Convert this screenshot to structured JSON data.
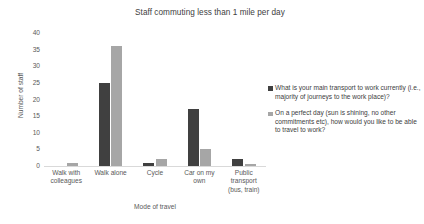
{
  "chart_data": {
    "type": "bar",
    "title": "Staff commuting less than 1 mile per day",
    "xlabel": "Mode of travel",
    "ylabel": "Number of staff",
    "ylim": [
      0,
      40
    ],
    "ytick_step": 5,
    "yticks": [
      0,
      5,
      10,
      15,
      20,
      25,
      30,
      35,
      40
    ],
    "grid": false,
    "legend_position": "right",
    "categories": [
      "Walk with colleagues",
      "Walk alone",
      "Cycle",
      "Car on my own",
      "Public transport (bus, train)"
    ],
    "category_lines": [
      [
        "Walk with",
        "colleagues"
      ],
      [
        "Walk alone"
      ],
      [
        "Cycle"
      ],
      [
        "Car on my",
        "own"
      ],
      [
        "Public",
        "transport",
        "(bus, train)"
      ]
    ],
    "series": [
      {
        "name": "What is your main transport to work currently (i.e., majority of journeys to the work place)?",
        "color": "#404040",
        "values": [
          0,
          25,
          1,
          17,
          2
        ]
      },
      {
        "name": "On a perfect day (sun is shining, no other commitments etc), how would you like to be able to travel to work?",
        "color": "#a6a6a6",
        "values": [
          1,
          36,
          2,
          5,
          0.5
        ]
      }
    ]
  },
  "legend": {
    "entries": [
      {
        "label": "What is your main transport to work currently (i.e., majority of journeys to the work place)?",
        "color": "#404040"
      },
      {
        "label": "On a perfect day (sun is shining, no other commitments etc), how would you like to be able to travel to work?",
        "color": "#a6a6a6"
      }
    ]
  },
  "colors": {
    "series_1": "#404040",
    "series_2": "#a6a6a6",
    "axis": "#d9d9d9",
    "text": "#595959",
    "background": "#ffffff"
  }
}
